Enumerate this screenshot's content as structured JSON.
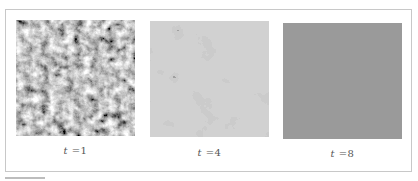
{
  "figure": {
    "panels": [
      {
        "id": "t1",
        "label_var": "t",
        "label_eq": " =1",
        "texture": "fine-noise",
        "dark_color": "#2a2a2a",
        "light_color": "#a0a0a0"
      },
      {
        "id": "t4",
        "label_var": "t",
        "label_eq": " =4",
        "texture": "coarse-clusters",
        "dark_color": "#1f1f1f",
        "light_color": "#a3a3a3"
      },
      {
        "id": "t8",
        "label_var": "t",
        "label_eq": " =8",
        "texture": "uniform",
        "fill_color": "#9a9a9a"
      }
    ]
  }
}
